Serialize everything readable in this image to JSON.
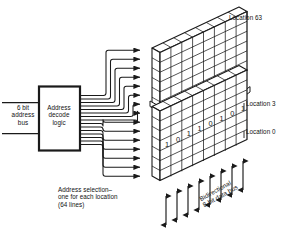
{
  "diagram": {
    "type": "block-diagram",
    "background_color": "#ffffff",
    "ink_color": "#1a1a1a"
  },
  "address_bus": {
    "label": "6 bit\naddress\nbus",
    "line1": "6 bit",
    "line2": "address",
    "line3": "bus",
    "width_bits": 6,
    "line_count": 2
  },
  "decoder_block": {
    "label": "Address\ndecode\nlogic",
    "line1": "Address",
    "line2": "decode",
    "line3": "logic"
  },
  "select_lines": {
    "caption": "Address selection–\none for each location\n(64 lines)",
    "line1": "Address selection–",
    "line2": "one for each location",
    "line3": "(64 lines)",
    "count": 64,
    "drawn_count": 14
  },
  "memory_array": {
    "locations_total": 64,
    "bits_per_location": 8,
    "labels": {
      "top": "Location 63",
      "middle": "Location 3",
      "bottom": "Location 0"
    },
    "highlighted_row_bits": [
      "1",
      "0",
      "1",
      "1",
      "0",
      "1",
      "0",
      "1"
    ],
    "break_line": true
  },
  "data_bus": {
    "label": "Bidirectional\n8-bit data bus",
    "line1": "Bidirectional",
    "line2": "8-bit data bus",
    "arrow_count": 8,
    "direction": "bidirectional",
    "width_bits": 8
  }
}
